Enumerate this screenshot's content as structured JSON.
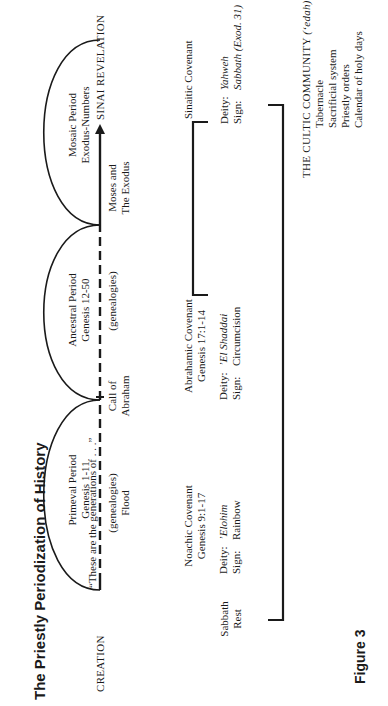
{
  "title": "The Priestly Periodization of History",
  "figure_label": "Figure 3",
  "timeline": {
    "start_label": "CREATION",
    "end_label": "SINAI REVELATION",
    "formula": "“These are the generations of . . .”",
    "events": [
      {
        "label_line1": "(genealogies)",
        "label_line2": "Flood"
      },
      {
        "label_line1": "Call of",
        "label_line2": "Abraham"
      },
      {
        "label_line1": "(genealogies)",
        "label_line2": ""
      },
      {
        "label_line1": "Moses and",
        "label_line2": "The Exodus"
      }
    ]
  },
  "periods": [
    {
      "name": "Primeval Period",
      "ref": "Genesis 1-11"
    },
    {
      "name": "Ancestral Period",
      "ref": "Genesis 12-50"
    },
    {
      "name": "Mosaic Period",
      "ref": "Exodus-Numbers"
    }
  ],
  "sabbath": {
    "line1": "Sabbath",
    "line2": "Rest"
  },
  "covenants": [
    {
      "name": "Noachic Covenant",
      "ref": "Genesis 9:1-17",
      "deity_label": "Deity:",
      "deity": "’Elohim",
      "sign_label": "Sign:",
      "sign": "Rainbow"
    },
    {
      "name": "Abrahamic Covenant",
      "ref": "Genesis 17:1-14",
      "deity_label": "Deity:",
      "deity": "’El Shaddai",
      "sign_label": "Sign:",
      "sign": "Circumcision"
    },
    {
      "name": "Sinaitic Covenant",
      "ref": "",
      "deity_label": "Deity:",
      "deity": "Yahweh",
      "sign_label": "Sign:",
      "sign": "Sabbath (Exod. 31)"
    }
  ],
  "community": {
    "heading": "THE CULTIC COMMUNITY",
    "heading_term": "(‘edah)",
    "items": [
      "Tabernacle",
      "Sacrificial system",
      "Priestly orders",
      "Calendar of holy days"
    ]
  },
  "colors": {
    "ink": "#1a1a1a",
    "background": "#ffffff"
  }
}
